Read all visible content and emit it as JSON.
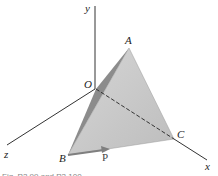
{
  "diagram": {
    "type": "3d-tetrahedron-axes",
    "axes": {
      "x_label": "x",
      "y_label": "y",
      "z_label": "z",
      "origin_label": "O"
    },
    "vertices": {
      "A": "A",
      "B": "B",
      "C": "C"
    },
    "force_label": "P",
    "caption": "Fig. P2.99 and P2.100",
    "colors": {
      "face_light": "#c8c8c8",
      "face_dark": "#8a8a8a",
      "axis": "#333333",
      "arrow": "#7f7f7f"
    }
  }
}
